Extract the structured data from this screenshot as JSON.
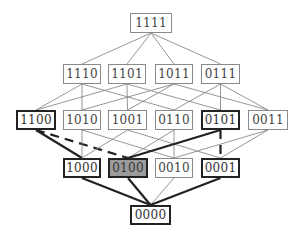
{
  "diagram": {
    "type": "lattice / Hasse diagram of 4-bit strings",
    "highlight_color": "#9a9a9a",
    "nodes": [
      {
        "id": "1111",
        "label": "1111",
        "x": 130,
        "y": 13,
        "w": 42,
        "style": "normal"
      },
      {
        "id": "1110",
        "label": "1110",
        "x": 63,
        "y": 64,
        "w": 38,
        "style": "normal"
      },
      {
        "id": "1101",
        "label": "1101",
        "x": 108,
        "y": 64,
        "w": 38,
        "style": "normal"
      },
      {
        "id": "1011",
        "label": "1011",
        "x": 155,
        "y": 64,
        "w": 38,
        "style": "normal"
      },
      {
        "id": "0111",
        "label": "0111",
        "x": 201,
        "y": 64,
        "w": 39,
        "style": "normal"
      },
      {
        "id": "1100",
        "label": "1100",
        "x": 16,
        "y": 110,
        "w": 40,
        "style": "bold"
      },
      {
        "id": "1010",
        "label": "1010",
        "x": 63,
        "y": 110,
        "w": 38,
        "style": "normal"
      },
      {
        "id": "1001",
        "label": "1001",
        "x": 108,
        "y": 110,
        "w": 39,
        "style": "normal"
      },
      {
        "id": "0110",
        "label": "0110",
        "x": 155,
        "y": 110,
        "w": 38,
        "style": "normal"
      },
      {
        "id": "0101",
        "label": "0101",
        "x": 201,
        "y": 110,
        "w": 39,
        "style": "bold"
      },
      {
        "id": "0011",
        "label": "0011",
        "x": 248,
        "y": 110,
        "w": 40,
        "style": "normal"
      },
      {
        "id": "1000",
        "label": "1000",
        "x": 63,
        "y": 158,
        "w": 38,
        "style": "bold"
      },
      {
        "id": "0100",
        "label": "0100",
        "x": 108,
        "y": 158,
        "w": 40,
        "style": "filled"
      },
      {
        "id": "0010",
        "label": "0010",
        "x": 155,
        "y": 158,
        "w": 38,
        "style": "normal"
      },
      {
        "id": "0001",
        "label": "0001",
        "x": 201,
        "y": 158,
        "w": 39,
        "style": "bold"
      },
      {
        "id": "0000",
        "label": "0000",
        "x": 130,
        "y": 205,
        "w": 41,
        "style": "bold"
      }
    ],
    "edges": [
      {
        "from": "1111",
        "to": "1110",
        "style": "thin"
      },
      {
        "from": "1111",
        "to": "1101",
        "style": "thin"
      },
      {
        "from": "1111",
        "to": "1011",
        "style": "thin"
      },
      {
        "from": "1111",
        "to": "0111",
        "style": "thin"
      },
      {
        "from": "1110",
        "to": "1100",
        "style": "thin"
      },
      {
        "from": "1110",
        "to": "1010",
        "style": "thin"
      },
      {
        "from": "1110",
        "to": "0110",
        "style": "thin"
      },
      {
        "from": "1101",
        "to": "1100",
        "style": "thin"
      },
      {
        "from": "1101",
        "to": "1001",
        "style": "thin"
      },
      {
        "from": "1101",
        "to": "0101",
        "style": "thin"
      },
      {
        "from": "1011",
        "to": "1010",
        "style": "thin"
      },
      {
        "from": "1011",
        "to": "1001",
        "style": "thin"
      },
      {
        "from": "1011",
        "to": "0011",
        "style": "thin"
      },
      {
        "from": "0111",
        "to": "0110",
        "style": "thin"
      },
      {
        "from": "0111",
        "to": "0101",
        "style": "thin"
      },
      {
        "from": "0111",
        "to": "0011",
        "style": "thin"
      },
      {
        "from": "1100",
        "to": "1000",
        "style": "bold"
      },
      {
        "from": "1100",
        "to": "0100",
        "style": "bold-dashed"
      },
      {
        "from": "1010",
        "to": "1000",
        "style": "thin"
      },
      {
        "from": "1010",
        "to": "0010",
        "style": "thin"
      },
      {
        "from": "1001",
        "to": "1000",
        "style": "thin"
      },
      {
        "from": "1001",
        "to": "0001",
        "style": "thin"
      },
      {
        "from": "0110",
        "to": "0100",
        "style": "thin"
      },
      {
        "from": "0110",
        "to": "0010",
        "style": "thin"
      },
      {
        "from": "0101",
        "to": "0100",
        "style": "bold"
      },
      {
        "from": "0101",
        "to": "0001",
        "style": "bold-dashed"
      },
      {
        "from": "0011",
        "to": "0010",
        "style": "thin"
      },
      {
        "from": "0011",
        "to": "0001",
        "style": "thin"
      },
      {
        "from": "1000",
        "to": "0000",
        "style": "bold"
      },
      {
        "from": "0100",
        "to": "0000",
        "style": "bold"
      },
      {
        "from": "0010",
        "to": "0000",
        "style": "thin"
      },
      {
        "from": "0001",
        "to": "0000",
        "style": "bold"
      }
    ]
  }
}
